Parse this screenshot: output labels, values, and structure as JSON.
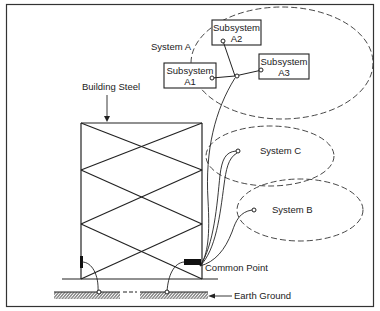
{
  "diagram": {
    "building_label": "Building Steel",
    "system_a": {
      "label": "System A",
      "subsystems": [
        {
          "line1": "Subsystem",
          "line2": "A1"
        },
        {
          "line1": "Subsystem",
          "line2": "A2"
        },
        {
          "line1": "Subsystem",
          "line2": "A3"
        }
      ]
    },
    "system_b": {
      "label": "System B"
    },
    "system_c": {
      "label": "System C"
    },
    "common_point_label": "Common Point",
    "earth_ground_label": "Earth Ground"
  },
  "colors": {
    "line": "#222222",
    "background": "#ffffff"
  }
}
